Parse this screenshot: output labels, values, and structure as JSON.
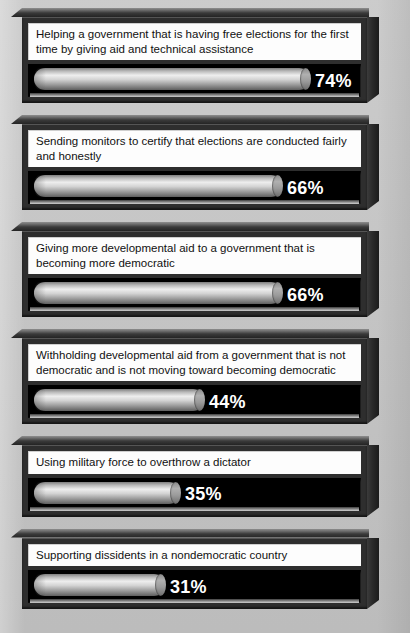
{
  "figure": {
    "background_color": "#c6c6c6",
    "panel_frame_color": "#2e2e2e",
    "track_color": "#000000",
    "bar_color": "#d4d4d4",
    "label_color": "#ffffff",
    "question_text_color": "#111111",
    "question_box_color": "#fdfdfd"
  },
  "chart_data": {
    "type": "bar",
    "title": "",
    "xlabel": "",
    "ylabel": "",
    "xlim": [
      0,
      100
    ],
    "grid": false,
    "legend": null,
    "orientation": "horizontal",
    "value_suffix": "%",
    "categories": [
      "Helping a government that is having free elections for the first time by giving aid and technical assistance",
      "Sending monitors to certify that elections are conducted fairly and honestly",
      "Giving more developmental aid to a government that is becoming more democratic",
      "Withholding developmental aid from a government that is not democratic and is not moving toward becoming democratic",
      "Using military force to overthrow a dictator",
      "Supporting dissidents in a nondemocratic country"
    ],
    "values": [
      74,
      66,
      66,
      44,
      35,
      31
    ],
    "labels": [
      "74%",
      "66%",
      "66%",
      "44%",
      "35%",
      "31%"
    ]
  },
  "panels": [
    {
      "question": "Helping a government that is having free elections for the first time by giving aid and technical assistance",
      "value": 74,
      "label": "74%",
      "bar_px": 276,
      "label_left_px": 287,
      "lines": 2
    },
    {
      "question": "Sending monitors to certify that elections are conducted fairly and honestly",
      "value": 66,
      "label": "66%",
      "bar_px": 248,
      "label_left_px": 259,
      "lines": 2
    },
    {
      "question": "Giving more developmental aid to a government that is becoming more democratic",
      "value": 66,
      "label": "66%",
      "bar_px": 248,
      "label_left_px": 259,
      "lines": 2
    },
    {
      "question": "Withholding developmental aid from a government that is not democratic and is not moving toward becoming democratic",
      "value": 44,
      "label": "44%",
      "bar_px": 170,
      "label_left_px": 181,
      "lines": 2
    },
    {
      "question": "Using military force to overthrow a dictator",
      "value": 35,
      "label": "35%",
      "bar_px": 146,
      "label_left_px": 157,
      "lines": 1
    },
    {
      "question": "Supporting dissidents in a nondemocratic country",
      "value": 31,
      "label": "31%",
      "bar_px": 131,
      "label_left_px": 142,
      "lines": 1
    }
  ]
}
